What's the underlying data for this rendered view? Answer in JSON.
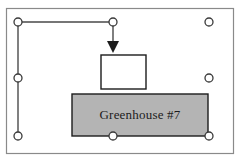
{
  "canvas": {
    "width": 244,
    "height": 168,
    "background_color": "#ffffff",
    "border_color": "#6b6b6b"
  },
  "selection": {
    "name": "selection-bounding-box",
    "stroke_color": "#4a4a4a",
    "handle_fill": "#ffffff",
    "handle_stroke": "#3a3a3a",
    "handle_radius": 4,
    "handles": [
      {
        "name": "handle-top-left",
        "x": 18,
        "y": 22
      },
      {
        "name": "handle-top-center",
        "x": 113,
        "y": 22
      },
      {
        "name": "handle-top-right",
        "x": 209,
        "y": 22
      },
      {
        "name": "handle-middle-left",
        "x": 18,
        "y": 78
      },
      {
        "name": "handle-middle-right",
        "x": 209,
        "y": 78
      },
      {
        "name": "handle-bottom-left",
        "x": 18,
        "y": 136
      },
      {
        "name": "handle-bottom-center",
        "x": 113,
        "y": 136
      },
      {
        "name": "handle-bottom-right",
        "x": 209,
        "y": 136
      }
    ]
  },
  "connector": {
    "name": "elbow-arrow-connector",
    "stroke_color": "#4a4a4a",
    "stroke_width": 1.4,
    "path": "M 18 22 L 113 22 L 113 45",
    "arrowhead": {
      "name": "arrowhead-down",
      "fill": "#1c1c1c",
      "points": "107,41 119,41 113,53"
    }
  },
  "shapes": [
    {
      "name": "white-rectangle-node",
      "type": "rectangle",
      "x": 101,
      "y": 55,
      "width": 45,
      "height": 34,
      "fill": "#ffffff",
      "stroke": "#1c1c1c",
      "stroke_width": 1.4,
      "label": ""
    },
    {
      "name": "greenhouse-box",
      "type": "rectangle",
      "x": 72,
      "y": 94,
      "width": 136,
      "height": 42,
      "fill": "#b4b4b4",
      "stroke": "#1c1c1c",
      "stroke_width": 1.4,
      "label": "Greenhouse #7"
    }
  ],
  "outer_frame": {
    "name": "diagram-frame",
    "x": 6,
    "y": 8,
    "width": 227,
    "height": 145,
    "stroke": "#8a8a8a",
    "stroke_width": 1.2,
    "fill": "none"
  }
}
